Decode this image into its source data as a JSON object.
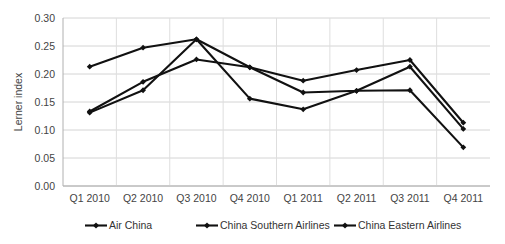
{
  "chart_data": {
    "type": "line",
    "title": "",
    "xlabel": "",
    "ylabel": "Lerner index",
    "ylim": [
      0.0,
      0.3
    ],
    "ytick_step": 0.05,
    "grid": true,
    "legend_position": "bottom",
    "categories": [
      "Q1 2010",
      "Q2 2010",
      "Q3 2010",
      "Q4 2010",
      "Q1 2011",
      "Q2 2011",
      "Q3 2011",
      "Q4 2011"
    ],
    "ytick_labels": [
      "0.00",
      "0.05",
      "0.10",
      "0.15",
      "0.20",
      "0.25",
      "0.30"
    ],
    "ytick_values": [
      0.0,
      0.05,
      0.1,
      0.15,
      0.2,
      0.25,
      0.3
    ],
    "series": [
      {
        "name": "Air China",
        "color": "#111111",
        "marker": "diamond",
        "values": [
          0.213,
          0.247,
          0.262,
          0.212,
          0.188,
          0.207,
          0.225,
          0.113
        ]
      },
      {
        "name": "China Southern Airlines",
        "color": "#111111",
        "marker": "diamond",
        "values": [
          0.133,
          0.186,
          0.226,
          0.212,
          0.167,
          0.17,
          0.213,
          0.102
        ]
      },
      {
        "name": "China Eastern Airlines",
        "color": "#111111",
        "marker": "diamond",
        "values": [
          0.131,
          0.171,
          0.262,
          0.156,
          0.137,
          0.17,
          0.171,
          0.069
        ]
      }
    ]
  },
  "legend": {
    "items": [
      {
        "label": "Air China"
      },
      {
        "label": "China Southern Airlines"
      },
      {
        "label": "China Eastern Airlines"
      }
    ]
  }
}
